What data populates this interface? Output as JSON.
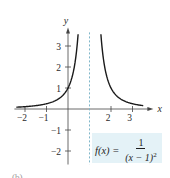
{
  "chart_data": {
    "type": "line",
    "title": "",
    "function_label_lhs": "f(x) =",
    "function_numerator": "1",
    "function_denominator": "(x − 1)",
    "function_denominator_exponent": "2",
    "xlabel": "x",
    "ylabel": "y",
    "xlim": [
      -2.4,
      3.6
    ],
    "ylim": [
      -2.5,
      3.6
    ],
    "x_ticks": [
      -2,
      -1,
      2,
      3
    ],
    "x_tick_labels": [
      "−2",
      "−1",
      "2",
      "3"
    ],
    "y_ticks": [
      -2,
      -1,
      1,
      2,
      3
    ],
    "y_tick_labels": [
      "−2",
      "−1",
      "1",
      "2",
      "3"
    ],
    "grid": false,
    "vertical_asymptote": {
      "x": 1,
      "style": "dashed",
      "color": "#7fb6c9"
    },
    "series": [
      {
        "name": "f(x) = 1/(x-1)^2",
        "color": "#1a1a1a",
        "segments": [
          {
            "x": [
              -2.4,
              -2,
              -1.5,
              -1,
              -0.5,
              0,
              0.25,
              0.47
            ],
            "y": [
              0.087,
              0.111,
              0.16,
              0.25,
              0.444,
              1,
              1.778,
              3.56
            ]
          },
          {
            "x": [
              1.53,
              1.75,
              2,
              2.5,
              3,
              3.5
            ],
            "y": [
              3.56,
              1.778,
              1,
              0.444,
              0.25,
              0.16
            ]
          }
        ]
      }
    ]
  },
  "figure": {
    "part_label": "(b)"
  }
}
